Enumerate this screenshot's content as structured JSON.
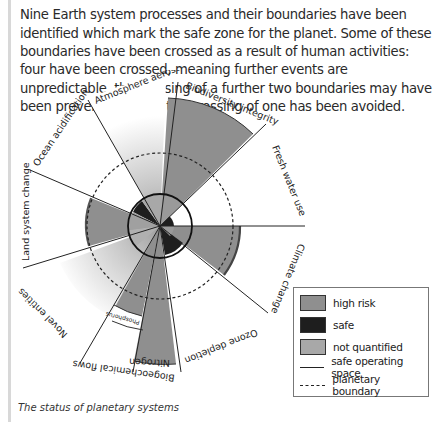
{
  "intro": {
    "text": "Nine Earth system processes and their boundaries have been identified which mark the safe zone for the planet. Some of these boundaries have been crossed as a result of human activities: four have been crossed, meaning further events are unpredictable, the crossing of a further two boundaries may have been preventable, and the crossing of one has been avoided."
  },
  "diagram": {
    "segments": [
      {
        "id": "biodiversity",
        "label": "Biodiversity integrity",
        "status": "high risk"
      },
      {
        "id": "freshwater",
        "label": "Fresh water use",
        "status": "safe"
      },
      {
        "id": "climate",
        "label": "Climate change",
        "status": "high risk"
      },
      {
        "id": "ozone",
        "label": "Ozone depletion",
        "status": "safe"
      },
      {
        "id": "nitrogen",
        "label": "Nitrogen",
        "status": "high risk"
      },
      {
        "id": "phosphorus",
        "label": "Phosphorus",
        "status": "high risk"
      },
      {
        "id": "novel",
        "label": "Novel entities",
        "status": "not quantified"
      },
      {
        "id": "landsystem",
        "label": "Land system change",
        "status": "high risk"
      },
      {
        "id": "ocean",
        "label": "Ocean acidification",
        "status": "safe"
      },
      {
        "id": "aerosols",
        "label": "Atmosphere aerosols",
        "status": "not quantified"
      }
    ],
    "group_label": "Biogeochemical flows"
  },
  "legend": {
    "high_risk": "high risk",
    "safe": "safe",
    "not_quantified": "not quantified",
    "safe_operating_space": "safe operating space",
    "planetary_boundary": "planetary boundary",
    "colors": {
      "high_risk": "#8f8f8f",
      "safe": "#1e1e1e",
      "not_quantified": "#a8a8a8"
    }
  },
  "caption": "The status of planetary systems"
}
